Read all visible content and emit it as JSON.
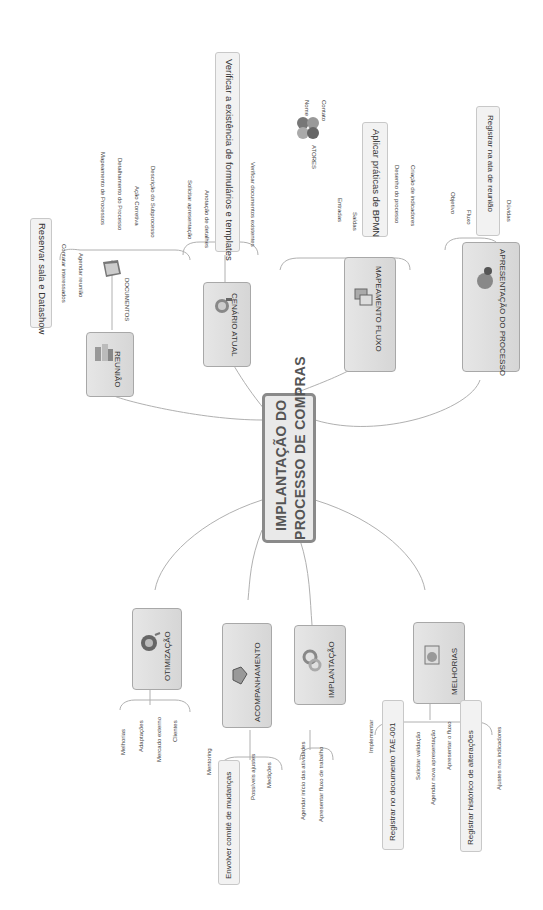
{
  "central": {
    "line1": "IMPLANTAÇÃO DO",
    "line2": "PROCESSO DE COMPRAS"
  },
  "branches_top": [
    {
      "id": "reuniao",
      "label": "REUNIÃO",
      "icon": "building-icon",
      "callout": "Reservar sala e Datashow",
      "children": [
        "Contatar interessados",
        "Agendar reunião"
      ],
      "subnode": {
        "label": "DOCUMENTOS",
        "icon": "documents-icon",
        "children": [
          "Mapeamento de Processos",
          "Detalhamento do Processo",
          "Ação Corretiva",
          "Descrição do Subprocesso"
        ]
      }
    },
    {
      "id": "cenario-atual",
      "label": "CENÁRIO ATUAL",
      "icon": "globe-magnifier-icon",
      "children": [
        "Solicitar apresentação",
        "Anotação de detalhes",
        "Verificar documentos existentes"
      ],
      "callout": "Verificar a existência de formulários e templates"
    },
    {
      "id": "mapeamento-fluxo",
      "label": "MAPEAMENTO FLUXO",
      "icon": "flowchart-icon",
      "children": [
        "Entradas",
        "Saídas",
        "Desenho do processo",
        "Criação de indicadores"
      ],
      "callout": "Aplicar práticas de BPMN",
      "subnode": {
        "label": "ATORES",
        "icon": "people-icon",
        "children": [
          "Nome",
          "Contato"
        ]
      }
    },
    {
      "id": "apresentacao",
      "label": "APRESENTAÇÃO DO PROCESSO",
      "icon": "presenter-icon",
      "children": [
        "Objetivo",
        "Fluxo",
        "Dúvidas"
      ],
      "callout": "Registrar na ata de reunião"
    }
  ],
  "branches_bottom": [
    {
      "id": "otimizacao",
      "label": "OTIMIZAÇÃO",
      "icon": "globe-icon",
      "children": [
        "Melhorias",
        "Adaptações",
        "Mercado externo",
        "Clientes"
      ]
    },
    {
      "id": "acompanhamento",
      "label": "ACOMPANHAMENTO",
      "icon": "handshake-icon",
      "children": [
        "Mentoring",
        "Possíveis ajustes",
        "Medições"
      ],
      "callout": "Envolver comitê de mudanças"
    },
    {
      "id": "implantacao",
      "label": "IMPLANTAÇÃO",
      "icon": "gears-icon",
      "children": [
        "Agendar início das atividades",
        "Apresentar fluxo de trabalho"
      ]
    },
    {
      "id": "melhorias",
      "label": "MELHORIAS",
      "icon": "document-icon",
      "children": [
        "Implementar",
        "Solicitar validação",
        "Agendar nova apresentação",
        "Apresentar o fluxo",
        "Ajustes nos indicadores"
      ],
      "callouts": [
        "Registrar no documento TAE-001",
        "Registrar histórico de alterações"
      ]
    }
  ],
  "colors": {
    "line": "#a8a8a8",
    "node_fill": "#dcdcdc",
    "node_border": "#a8a8a8",
    "central_border": "#8a8a8a"
  }
}
